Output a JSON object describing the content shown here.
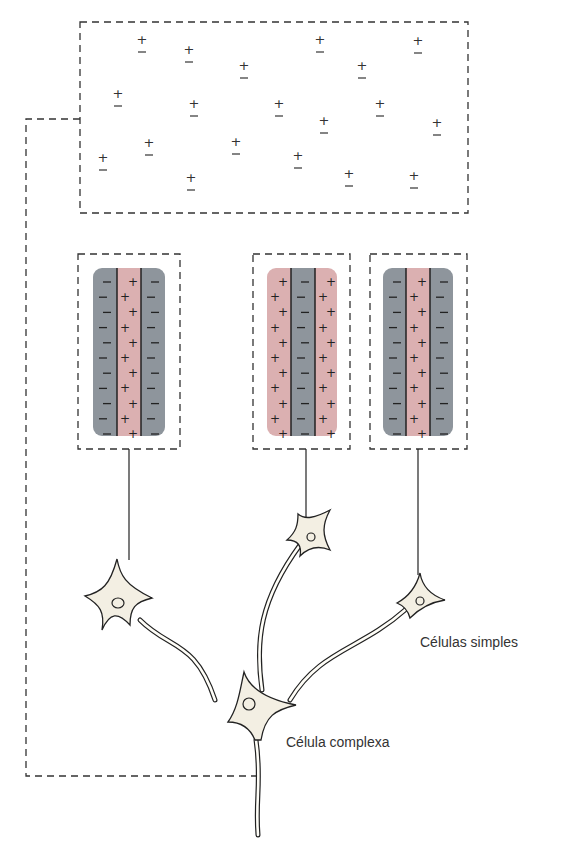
{
  "labels": {
    "simple_cells": "Células simples",
    "complex_cell": "Célula complexa"
  },
  "colors": {
    "excitatory_stripe": "#dbb0b1",
    "inhibitory_stripe": "#8e959c",
    "neuron_fill": "#f3efe3",
    "line": "#222222"
  },
  "receptive_fields": [
    {
      "name": "left",
      "stripes": [
        "-",
        "+",
        "-"
      ]
    },
    {
      "name": "middle",
      "stripes": [
        "+",
        "-",
        "+"
      ]
    },
    {
      "name": "right",
      "stripes": [
        "-",
        "+",
        "-"
      ]
    }
  ],
  "top_field": {
    "content": "scattered +/- pairs (complex cell receptive field)"
  }
}
